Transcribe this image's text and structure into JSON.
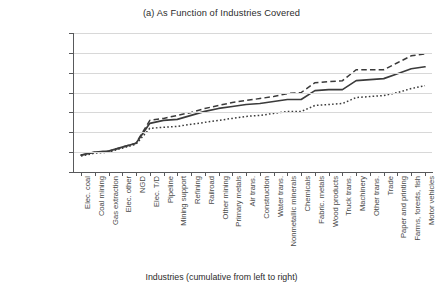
{
  "chart_data": {
    "type": "line",
    "title": "(a) As Function of Industries Covered",
    "xlabel": "Industries (cumulative from left to right)",
    "ylabel": "Additional welfare cost per ton relative to 100% auctioning",
    "ylim": [
      0,
      7
    ],
    "ytick_labels": [
      "$0",
      "$1",
      "$2",
      "$3",
      "$4",
      "$5",
      "$6",
      "$7"
    ],
    "ytick_values": [
      0,
      1,
      2,
      3,
      4,
      5,
      6,
      7
    ],
    "grid": true,
    "legend_position": "none",
    "categories": [
      "Elec. coal",
      "Coal mining",
      "Gas extraction",
      "Elec. other",
      "NGD",
      "Elec. T/D",
      "Pipeline",
      "Mining support",
      "Refining",
      "Railroad",
      "Other mining",
      "Primary metals",
      "Air trans.",
      "Construction",
      "Water trans.",
      "Nonmetallic minerals",
      "Chemicals",
      "Fabric. metals",
      "Wood products",
      "Truck trans.",
      "Machinery",
      "Other trans.",
      "Trade",
      "Paper and printing",
      "Farms, forests, fish",
      "Motor vehicles"
    ],
    "series": [
      {
        "name": "Upper bound",
        "style": "dashed",
        "values": [
          0.85,
          1.0,
          1.05,
          1.25,
          1.45,
          2.6,
          2.7,
          2.85,
          3.0,
          3.2,
          3.35,
          3.5,
          3.6,
          3.7,
          3.8,
          3.95,
          4.0,
          4.5,
          4.55,
          4.6,
          5.15,
          5.15,
          5.15,
          5.5,
          5.85,
          5.95
        ]
      },
      {
        "name": "Central estimate",
        "style": "solid",
        "values": [
          0.85,
          1.0,
          1.05,
          1.25,
          1.45,
          2.45,
          2.6,
          2.65,
          2.85,
          3.05,
          3.2,
          3.3,
          3.4,
          3.45,
          3.55,
          3.65,
          3.65,
          4.1,
          4.15,
          4.15,
          4.6,
          4.65,
          4.7,
          4.95,
          5.2,
          5.3
        ]
      },
      {
        "name": "Lower bound",
        "style": "dotted",
        "values": [
          0.8,
          0.95,
          1.0,
          1.2,
          1.4,
          2.2,
          2.25,
          2.3,
          2.4,
          2.5,
          2.6,
          2.7,
          2.8,
          2.85,
          2.95,
          3.05,
          3.05,
          3.35,
          3.4,
          3.45,
          3.75,
          3.8,
          3.85,
          4.0,
          4.2,
          4.35
        ]
      }
    ]
  }
}
